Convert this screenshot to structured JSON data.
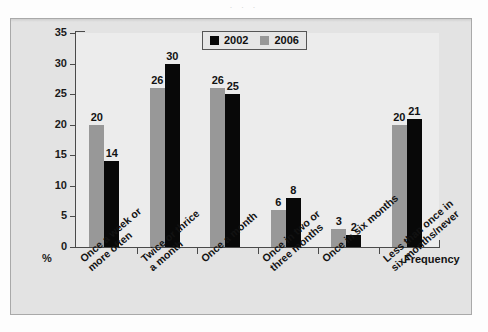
{
  "page": {
    "bleed_text": "· · ·"
  },
  "legend": {
    "position": "top-center",
    "entries": [
      {
        "label": "2002",
        "color": "#080808",
        "icon": "legend-swatch-black"
      },
      {
        "label": "2006",
        "color": "#989898",
        "icon": "legend-swatch-gray"
      }
    ]
  },
  "axes": {
    "y_label": "%",
    "x_title": "Frequency",
    "y_ticks": [
      "0",
      "5",
      "10",
      "15",
      "20",
      "25",
      "30",
      "35"
    ]
  },
  "chart_data": {
    "type": "bar",
    "title": "",
    "subtitle": "",
    "xlabel": "Frequency",
    "ylabel": "%",
    "ylim": [
      0,
      35
    ],
    "ytick_step": 5,
    "grid": false,
    "legend_position": "top-center",
    "categories": [
      "Once a week or more often",
      "Twice or thrice a month",
      "Once a month",
      "Once in two or three months",
      "Once in six months",
      "Less than once in six months/never"
    ],
    "category_lines": [
      [
        "Once a week or",
        "more often"
      ],
      [
        "Twice or thrice",
        "a month"
      ],
      [
        "Once a month"
      ],
      [
        "Once in two or",
        "three months"
      ],
      [
        "Once in six months"
      ],
      [
        "Less than once in",
        "six months/never"
      ]
    ],
    "series": [
      {
        "name": "2006",
        "color": "#989898",
        "values": [
          20,
          26,
          26,
          6,
          3,
          20
        ]
      },
      {
        "name": "2002",
        "color": "#080808",
        "values": [
          14,
          30,
          25,
          8,
          2,
          21
        ]
      }
    ],
    "series_draw_order": [
      "2006",
      "2002"
    ],
    "data_labels": true
  }
}
